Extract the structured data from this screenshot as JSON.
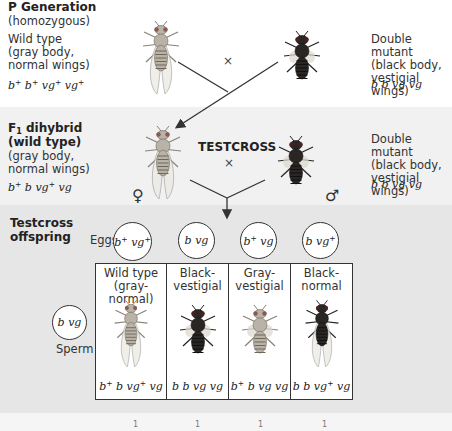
{
  "p_generation": {
    "title": "P Generation",
    "subtitle": "(homozygous)",
    "left": {
      "line1": "Wild type",
      "line2": "(gray body,",
      "line3": "normal wings)",
      "genotype_html": "b<sup>+</sup> b<sup>+</sup> vg<sup>+</sup> vg<sup>+</sup>"
    },
    "right": {
      "line1": "Double mutant",
      "line2": "(black body,",
      "line3": "vestigial wings)",
      "genotype": "b b vg vg"
    },
    "cross_symbol": "×"
  },
  "f1": {
    "title_main": "F",
    "title_sub": "1",
    "title_rest": " dihybrid",
    "title_line2": "(wild type)",
    "line3": "(gray body,",
    "line4": "normal wings)",
    "genotype_html": "b<sup>+</sup> b vg<sup>+</sup> vg",
    "female_symbol": "♀",
    "cross_label": "TESTCROSS",
    "cross_symbol": "×",
    "male_symbol": "♂",
    "right": {
      "line1": "Double mutant",
      "line2": "(black body,",
      "line3": "vestigial wings)",
      "genotype": "b b vg vg"
    }
  },
  "testcross": {
    "title_line1": "Testcross",
    "title_line2": "offspring",
    "eggs_label": "Eggs",
    "eggs": [
      {
        "genotype_html": "b<sup>+</sup> vg<sup>+</sup>"
      },
      {
        "genotype_html": "b vg"
      },
      {
        "genotype_html": "b<sup>+</sup> vg"
      },
      {
        "genotype_html": "b vg<sup>+</sup>"
      }
    ],
    "sperm_label": "Sperm",
    "sperm_genotype": "b vg",
    "offspring": [
      {
        "line1": "Wild type",
        "line2": "(gray-normal)",
        "genotype_html": "b<sup>+</sup> b vg<sup>+</sup> vg",
        "body": "gray",
        "wings": "normal"
      },
      {
        "line1": "Black-",
        "line2": "vestigial",
        "genotype_html": "b b vg vg",
        "body": "black",
        "wings": "vestigial"
      },
      {
        "line1": "Gray-",
        "line2": "vestigial",
        "genotype_html": "b<sup>+</sup> b vg vg",
        "body": "gray",
        "wings": "vestigial"
      },
      {
        "line1": "Black-",
        "line2": "normal",
        "genotype_html": "b b vg<sup>+</sup> vg",
        "body": "black",
        "wings": "normal"
      }
    ]
  },
  "bottom_strip": {
    "partial_ratio_marks": [
      "1",
      "1",
      "1",
      "1"
    ]
  },
  "colors": {
    "band_p": "#ffffff",
    "band_f1": "#f1f1f1",
    "band_testcross": "#e6e6e6",
    "line": "#333333",
    "gray_fly": "#b9b2a6",
    "black_fly": "#2a2624"
  }
}
